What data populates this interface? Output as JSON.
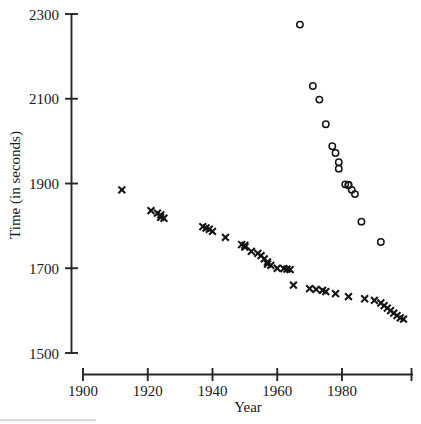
{
  "chart_data": {
    "type": "scatter",
    "title": "",
    "xlabel": "Year",
    "ylabel": "Time (in seconds)",
    "xlim": [
      1900,
      2001
    ],
    "ylim": [
      1500,
      2300
    ],
    "grid": false,
    "legend": null,
    "xticks": [
      1900,
      1920,
      1940,
      1960,
      1980
    ],
    "xtick_labels": [
      "1900",
      "1920",
      "1940",
      "1960",
      "1980"
    ],
    "yticks": [
      1500,
      1700,
      1900,
      2100,
      2300
    ],
    "ytick_labels": [
      "1500",
      "1700",
      "1900",
      "2100",
      "2300"
    ],
    "series": [
      {
        "name": "men",
        "marker": "x",
        "color": "#141414",
        "points": [
          [
            1912,
            1885
          ],
          [
            1921,
            1836
          ],
          [
            1923,
            1830
          ],
          [
            1924,
            1826
          ],
          [
            1924,
            1820
          ],
          [
            1925,
            1818
          ],
          [
            1937,
            1798
          ],
          [
            1938,
            1795
          ],
          [
            1939,
            1792
          ],
          [
            1940,
            1787
          ],
          [
            1944,
            1773
          ],
          [
            1949,
            1756
          ],
          [
            1950,
            1754
          ],
          [
            1950,
            1750
          ],
          [
            1952,
            1740
          ],
          [
            1954,
            1735
          ],
          [
            1955,
            1730
          ],
          [
            1956,
            1722
          ],
          [
            1957,
            1715
          ],
          [
            1957,
            1710
          ],
          [
            1958,
            1707
          ],
          [
            1960,
            1700
          ],
          [
            1962,
            1699
          ],
          [
            1963,
            1698
          ],
          [
            1964,
            1697
          ],
          [
            1965,
            1660
          ],
          [
            1970,
            1652
          ],
          [
            1972,
            1650
          ],
          [
            1974,
            1648
          ],
          [
            1975,
            1645
          ],
          [
            1978,
            1640
          ],
          [
            1982,
            1633
          ],
          [
            1987,
            1628
          ],
          [
            1990,
            1624
          ],
          [
            1992,
            1618
          ],
          [
            1993,
            1612
          ],
          [
            1994,
            1606
          ],
          [
            1995,
            1600
          ],
          [
            1996,
            1594
          ],
          [
            1997,
            1588
          ],
          [
            1998,
            1583
          ],
          [
            1999,
            1580
          ]
        ]
      },
      {
        "name": "women",
        "marker": "o",
        "color": "#141414",
        "points": [
          [
            1967,
            2275
          ],
          [
            1971,
            2130
          ],
          [
            1973,
            2098
          ],
          [
            1975,
            2040
          ],
          [
            1977,
            1988
          ],
          [
            1978,
            1972
          ],
          [
            1979,
            1950
          ],
          [
            1979,
            1935
          ],
          [
            1981,
            1898
          ],
          [
            1982,
            1897
          ],
          [
            1982,
            1896
          ],
          [
            1983,
            1885
          ],
          [
            1984,
            1875
          ],
          [
            1986,
            1810
          ],
          [
            1992,
            1762
          ]
        ]
      }
    ]
  },
  "axes": {
    "x_axis_name": "year-axis",
    "y_axis_name": "time-axis"
  }
}
